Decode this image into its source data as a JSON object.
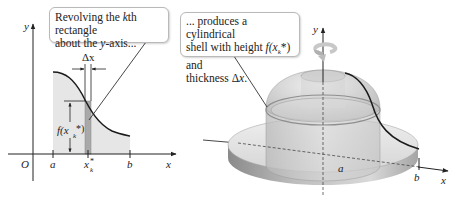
{
  "left_panel": {
    "callout_text_1": "Revolving the ",
    "callout_k": "k",
    "callout_text_2": "th rectangle",
    "callout_text_3": "about the ",
    "callout_y": "y",
    "callout_text_4": "-axis...",
    "axis_y_label": "y",
    "axis_x_label": "x",
    "origin_label": "O",
    "tick_a": "a",
    "tick_b": "b",
    "tick_xk": "x",
    "tick_xk_sub": "k",
    "tick_xk_sup": "*",
    "delta_x_label": "Δx",
    "height_label_f": "f(x",
    "height_label_sub": "k",
    "height_label_end": "*)"
  },
  "right_panel": {
    "callout_line1": "... produces a cylindrical",
    "callout_line2_a": "shell with height ",
    "callout_line2_f": "f(x",
    "callout_line2_sub": "k",
    "callout_line2_end": "*) and",
    "callout_line3_a": "thickness Δ",
    "callout_line3_x": "x",
    "callout_line3_end": ".",
    "axis_y_label": "y",
    "axis_x_label": "x",
    "tick_a": "a",
    "tick_b": "b"
  },
  "colors": {
    "region_fill": "#e6e6e6",
    "strip_fill": "#a9a9a9",
    "curve": "#1a1a1a",
    "callout_border": "#b9b9b9"
  }
}
